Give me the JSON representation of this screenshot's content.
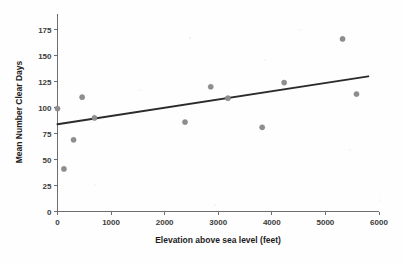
{
  "chart_data": {
    "type": "scatter",
    "title": "",
    "xlabel": "Elevation above sea level (feet)",
    "ylabel": "Mean Number Clear Days",
    "xlim": [
      0,
      6000
    ],
    "ylim": [
      0,
      190
    ],
    "xticks": [
      0,
      1000,
      2000,
      3000,
      4000,
      5000,
      6000
    ],
    "xtick_labels": [
      "0",
      "1000",
      "2000",
      "3000",
      "4000",
      "5000",
      "6000"
    ],
    "yticks": [
      0,
      25,
      50,
      75,
      100,
      125,
      150,
      175
    ],
    "ytick_labels": [
      "0",
      "25",
      "50",
      "75",
      "100",
      "125",
      "150",
      "175"
    ],
    "grid": false,
    "legend": null,
    "point_color": "#8e8e8e",
    "line_color": "#2b2b2b",
    "points": [
      {
        "x": 0,
        "y": 99
      },
      {
        "x": 120,
        "y": 41
      },
      {
        "x": 300,
        "y": 69
      },
      {
        "x": 460,
        "y": 110
      },
      {
        "x": 690,
        "y": 90
      },
      {
        "x": 2380,
        "y": 86
      },
      {
        "x": 2860,
        "y": 120
      },
      {
        "x": 3180,
        "y": 109
      },
      {
        "x": 3820,
        "y": 81
      },
      {
        "x": 4230,
        "y": 124
      },
      {
        "x": 5320,
        "y": 166
      },
      {
        "x": 5580,
        "y": 113
      }
    ],
    "trend_line": {
      "name": "fitted regression line",
      "x_start": 0,
      "y_start": 84,
      "x_end": 5800,
      "y_end": 130
    }
  }
}
